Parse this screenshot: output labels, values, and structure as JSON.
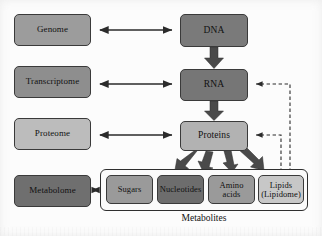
{
  "figure": {
    "caption_label": "Metabolites"
  },
  "omics_column": [
    {
      "id": "genome",
      "label": "Genome",
      "color": "#9c9c9c",
      "x": 14,
      "y": 14,
      "w": 77,
      "h": 32
    },
    {
      "id": "transcriptome",
      "label": "Transcriptome",
      "color": "#8e8e8e",
      "x": 14,
      "y": 66,
      "w": 77,
      "h": 32
    },
    {
      "id": "proteome",
      "label": "Proteome",
      "color": "#bcbcbc",
      "x": 14,
      "y": 118,
      "w": 77,
      "h": 32
    },
    {
      "id": "metabolome",
      "label": "Metabolome",
      "color": "#6f6f6f",
      "x": 14,
      "y": 175,
      "w": 77,
      "h": 32
    }
  ],
  "central_column": [
    {
      "id": "dna",
      "label": "DNA",
      "color": "#7a7a7a",
      "x": 180,
      "y": 14,
      "w": 68,
      "h": 33
    },
    {
      "id": "rna",
      "label": "RNA",
      "color": "#767676",
      "x": 180,
      "y": 69,
      "w": 68,
      "h": 32
    },
    {
      "id": "proteins",
      "label": "Proteins",
      "color": "#b2b2b2",
      "x": 180,
      "y": 121,
      "w": 68,
      "h": 30
    }
  ],
  "metabolites_group": {
    "frame": {
      "x": 100,
      "y": 169,
      "w": 208,
      "h": 42
    },
    "items": [
      {
        "id": "sugars",
        "label": "Sugars",
        "label2": "",
        "color": "#9a9a9a",
        "x": 106,
        "y": 175,
        "w": 47,
        "h": 29
      },
      {
        "id": "nucleotides",
        "label": "Nucleotides",
        "label2": "",
        "color": "#6d6d6d",
        "x": 157,
        "y": 175,
        "w": 47,
        "h": 29
      },
      {
        "id": "amino-acids",
        "label": "Amino",
        "label2": "acids",
        "color": "#9a9a9a",
        "x": 208,
        "y": 175,
        "w": 47,
        "h": 29
      },
      {
        "id": "lipids",
        "label": "Lipids",
        "label2": "(Lipidome)",
        "color": "#c7c7c7",
        "x": 258,
        "y": 175,
        "w": 46,
        "h": 29
      }
    ]
  },
  "connections": {
    "bidirectional": [
      {
        "id": "genome-dna",
        "from": "Genome",
        "to": "DNA",
        "style": "solid-double"
      },
      {
        "id": "transcriptome-rna",
        "from": "Transcriptome",
        "to": "RNA",
        "style": "solid-double"
      },
      {
        "id": "proteome-proteins",
        "from": "Proteome",
        "to": "Proteins",
        "style": "solid-double"
      },
      {
        "id": "metabolome-sugars",
        "from": "Metabolome",
        "to": "Metabolites",
        "style": "solid-double-short"
      }
    ],
    "flow": [
      {
        "id": "dna-rna",
        "from": "DNA",
        "to": "RNA",
        "style": "block-arrow"
      },
      {
        "id": "rna-proteins",
        "from": "RNA",
        "to": "Proteins",
        "style": "block-arrow"
      }
    ],
    "fanout": [
      {
        "id": "proteins-sugars",
        "from": "Proteins",
        "to": "Sugars"
      },
      {
        "id": "proteins-nucleotides",
        "from": "Proteins",
        "to": "Nucleotides"
      },
      {
        "id": "proteins-amino",
        "from": "Proteins",
        "to": "Amino acids"
      },
      {
        "id": "proteins-lipids",
        "from": "Proteins",
        "to": "Lipids"
      }
    ],
    "feedback": [
      {
        "id": "lipids-rna",
        "from": "Lipids",
        "to": "RNA",
        "style": "dashed"
      },
      {
        "id": "lipids-proteins",
        "from": "Lipids",
        "to": "Proteins",
        "style": "dashed"
      }
    ]
  },
  "style_tokens": {
    "line_color": "#2b2b2b",
    "box_border": "#3a3a3a",
    "text_color": "#111111",
    "background": "#fcfcfc"
  }
}
